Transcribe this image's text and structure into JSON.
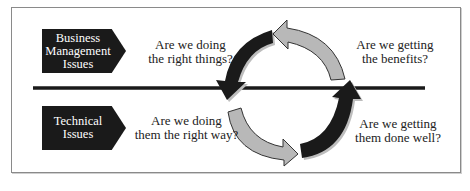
{
  "diagram": {
    "categories": [
      {
        "id": "business",
        "label_lines": [
          "Business",
          "Management",
          "Issues"
        ]
      },
      {
        "id": "technical",
        "label_lines": [
          "Technical",
          "Issues"
        ]
      }
    ],
    "questions": {
      "top_left": [
        "Are we doing",
        "the right things?"
      ],
      "top_right": [
        "Are we getting",
        "the benefits?"
      ],
      "bottom_left": [
        "Are we doing",
        "them the right way?"
      ],
      "bottom_right": [
        "Are we getting",
        "them done well?"
      ]
    },
    "cycle_arrows": [
      {
        "position": "top-left",
        "color": "#1a1a1a",
        "direction": "down"
      },
      {
        "position": "top-right",
        "color": "#b8b8b8",
        "direction": "left"
      },
      {
        "position": "bottom-left",
        "color": "#b8b8b8",
        "direction": "right"
      },
      {
        "position": "bottom-right",
        "color": "#1a1a1a",
        "direction": "up"
      }
    ],
    "colors": {
      "dark": "#1a1a1a",
      "light_arrow": "#b8b8b8",
      "frame": "#8a8a8a"
    }
  }
}
